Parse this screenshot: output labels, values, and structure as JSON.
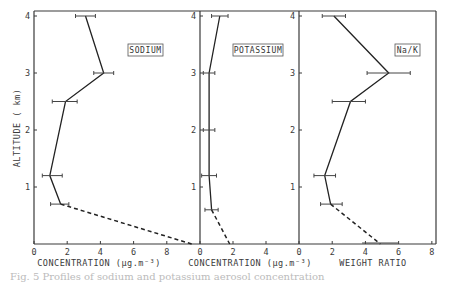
{
  "chart_data": [
    {
      "type": "line",
      "title": "SODIUM",
      "xlabel": "CONCENTRATION (µg.m⁻³)",
      "ylabel": "ALTITUDE ( km)",
      "xlim": [
        0,
        10
      ],
      "ylim": [
        0,
        4
      ],
      "xticks": [
        0,
        2,
        4,
        6,
        8
      ],
      "yticks": [
        1,
        2,
        3,
        4
      ],
      "series": [
        {
          "name": "measured",
          "style": "solid",
          "points": [
            [
              3.1,
              4.0
            ],
            [
              4.2,
              3.0
            ],
            [
              1.9,
              2.5
            ],
            [
              0.95,
              1.2
            ],
            [
              1.6,
              0.7
            ]
          ],
          "errors": [
            [
              2.5,
              3.7
            ],
            [
              3.6,
              4.8
            ],
            [
              1.1,
              2.6
            ],
            [
              0.5,
              1.7
            ],
            [
              1.0,
              2.1
            ]
          ]
        },
        {
          "name": "extrapolated",
          "style": "dashed",
          "points": [
            [
              1.6,
              0.7
            ],
            [
              9.5,
              0.0
            ]
          ]
        }
      ],
      "grid": false
    },
    {
      "type": "line",
      "title": "POTASSIUM",
      "xlabel": "CONCENTRATION (µg.m⁻³)",
      "xlim": [
        0,
        6
      ],
      "ylim": [
        0,
        4
      ],
      "xticks": [
        0,
        2,
        4
      ],
      "yticks": [
        1,
        2,
        3,
        4
      ],
      "series": [
        {
          "name": "measured",
          "style": "solid",
          "points": [
            [
              1.2,
              4.0
            ],
            [
              0.55,
              3.0
            ],
            [
              0.55,
              2.0
            ],
            [
              0.55,
              1.2
            ],
            [
              0.7,
              0.6
            ]
          ],
          "errors": [
            [
              0.7,
              1.7
            ],
            [
              0.2,
              0.9
            ],
            [
              0.2,
              0.9
            ],
            [
              0.1,
              1.0
            ],
            [
              0.3,
              1.1
            ]
          ]
        },
        {
          "name": "extrapolated",
          "style": "dashed",
          "points": [
            [
              0.7,
              0.6
            ],
            [
              1.8,
              0.0
            ]
          ]
        }
      ],
      "grid": false
    },
    {
      "type": "line",
      "title": "Na/K",
      "xlabel": "WEIGHT  RATIO",
      "xlim": [
        0,
        8.25
      ],
      "ylim": [
        0,
        4
      ],
      "xticks": [
        0,
        2,
        4,
        6,
        8
      ],
      "yticks": [
        1,
        2,
        3,
        4
      ],
      "series": [
        {
          "name": "measured",
          "style": "solid",
          "points": [
            [
              2.1,
              4.0
            ],
            [
              5.4,
              3.0
            ],
            [
              3.1,
              2.5
            ],
            [
              1.55,
              1.2
            ],
            [
              1.9,
              0.7
            ]
          ],
          "errors": [
            [
              1.4,
              2.8
            ],
            [
              4.1,
              6.7
            ],
            [
              2.0,
              4.0
            ],
            [
              0.9,
              2.2
            ],
            [
              1.3,
              2.6
            ]
          ]
        },
        {
          "name": "extrapolated",
          "style": "dashed",
          "points": [
            [
              1.9,
              0.7
            ],
            [
              4.9,
              0.0
            ]
          ]
        }
      ],
      "baseline_error": [
        3.8,
        6.0
      ],
      "grid": false
    }
  ],
  "labels": {
    "sodium_box": "SODIUM",
    "potassium_box": "POTASSIUM",
    "ratio_box": "Na/K",
    "y_axis": "ALTITUDE ( km)",
    "x_sodium": "CONCENTRATION (µg.m⁻³)",
    "x_potassium": "CONCENTRATION (µg.m⁻³)",
    "x_ratio": "WEIGHT   RATIO"
  },
  "caption": "Fig. 5  Profiles of sodium and potassium aerosol concentration"
}
